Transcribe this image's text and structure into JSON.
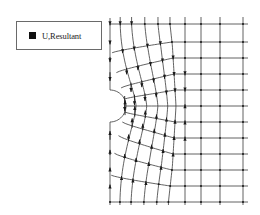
{
  "legend": {
    "label": "U,Resultant",
    "swatch_color": "#111111"
  },
  "colors": {
    "mesh_line": "#3a3a3a",
    "arrow": "#1a1a1a",
    "background": "#ffffff"
  },
  "mesh": {
    "left_x": 110,
    "right_x": 248,
    "top_y": 24,
    "bottom_y": 202,
    "hole_center": [
      110,
      106
    ],
    "hole_radius": 16,
    "transition_radius": 66,
    "horizontal_lines_y": [
      24,
      42,
      58,
      74,
      90,
      106,
      122,
      138,
      154,
      170,
      186,
      202
    ],
    "outer_vertical_lines_x": [
      185,
      201,
      220,
      243
    ],
    "radial_rings": 5,
    "radial_spokes": 8
  },
  "field": {
    "name": "U, Resultant",
    "description": "Displacement vectors on FE mesh around semicircular hole; above hole arrows point downward, below hole arrows point upward; magnitude decays away from hole"
  }
}
